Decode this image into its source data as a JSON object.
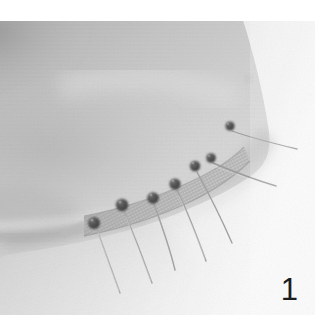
{
  "figure": {
    "number_label": "1",
    "caption": ""
  },
  "photo": {
    "alt": "Macro photograph of pale gray fabric, its curved hem edge overlaid with a narrow woven mesh band, secured by eight straight pins whose dark round heads sit above the edge and whose shafts emerge below",
    "palette": {
      "page_background": "#ffffff",
      "photo_background": "#f2f2f2",
      "fabric_light": "#d9d9d9",
      "fabric_mid": "#c3c3c3",
      "fabric_shadow": "#9a9a9a",
      "fabric_dark_fold": "#8d8d8d",
      "mesh_band": "#b5b5b5",
      "pin_head": "#4a4a4a",
      "pin_shaft": "#a9a9a9",
      "label_text": "#1d1d1d"
    },
    "geometry": {
      "plate_x": 0,
      "plate_y": 21,
      "plate_width": 315,
      "plate_height": 294
    },
    "pins": [
      {
        "id": "pin-1",
        "head_x": 94,
        "head_y": 202,
        "head_r": 6.0,
        "tip_x": 120,
        "tip_y": 272
      },
      {
        "id": "pin-2",
        "head_x": 122,
        "head_y": 184,
        "head_r": 6.2,
        "tip_x": 152,
        "tip_y": 262
      },
      {
        "id": "pin-3",
        "head_x": 153,
        "head_y": 177,
        "head_r": 5.8,
        "tip_x": 175,
        "tip_y": 249
      },
      {
        "id": "pin-4",
        "head_x": 175,
        "head_y": 163,
        "head_r": 5.6,
        "tip_x": 206,
        "tip_y": 240
      },
      {
        "id": "pin-5",
        "head_x": 195,
        "head_y": 145,
        "head_r": 5.2,
        "tip_x": 232,
        "tip_y": 222
      },
      {
        "id": "pin-6",
        "head_x": 211,
        "head_y": 137,
        "head_r": 4.8,
        "tip_x": 276,
        "tip_y": 165
      },
      {
        "id": "pin-7",
        "head_x": 230,
        "head_y": 105,
        "head_r": 4.6,
        "tip_x": 297,
        "tip_y": 128
      },
      {
        "id": "pin-8",
        "head_x": 249,
        "head_y": 58,
        "head_r": 2.6,
        "tip_x": 262,
        "tip_y": 72
      }
    ]
  }
}
